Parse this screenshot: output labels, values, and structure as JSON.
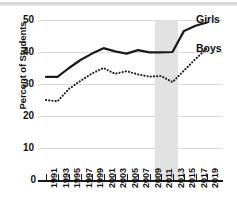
{
  "chart_data": {
    "type": "line",
    "title": "",
    "xlabel": "",
    "ylabel": "Percent of Students",
    "ylim": [
      0,
      50
    ],
    "yticks": [
      0,
      10,
      20,
      30,
      40,
      50
    ],
    "grid": true,
    "legend_position": "right",
    "x": [
      1991,
      1993,
      1995,
      1997,
      1999,
      2001,
      2003,
      2005,
      2007,
      2009,
      2011,
      2013,
      2015,
      2017,
      2019
    ],
    "xtick_labels": [
      "1991",
      "1993",
      "1995",
      "1997",
      "1999",
      "2001",
      "2003",
      "2005",
      "2007",
      "2009",
      "2011",
      "2013",
      "2015",
      "2017",
      "2019"
    ],
    "series": [
      {
        "name": "Girls",
        "style": "solid",
        "color": "#1a1a1a",
        "values": [
          32.2,
          32.2,
          35.0,
          37.5,
          39.5,
          41.2,
          40.2,
          39.5,
          40.6,
          39.9,
          39.9,
          40.0,
          46.6,
          48.2,
          49.2
        ]
      },
      {
        "name": "Boys",
        "style": "dotted",
        "color": "#1a1a1a",
        "values": [
          25.0,
          24.6,
          28.5,
          31.0,
          33.3,
          35.0,
          33.2,
          34.0,
          33.0,
          32.3,
          32.5,
          30.6,
          34.2,
          37.8,
          41.2
        ]
      }
    ],
    "shaded_band": {
      "label": "",
      "x_start": 2010,
      "x_end": 2014,
      "color": "#e2e2e2"
    }
  },
  "legend": {
    "girls": "Girls",
    "boys": "Boys"
  },
  "axis": {
    "y_title": "Percent of Students",
    "zero": "0"
  }
}
